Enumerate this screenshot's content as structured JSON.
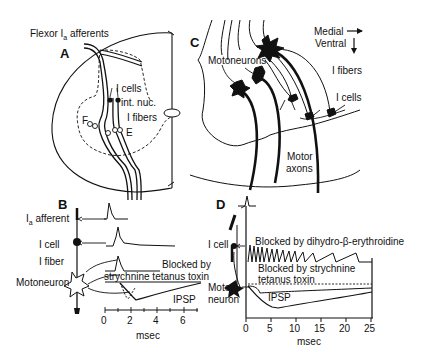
{
  "figure": {
    "panels": {
      "A": {
        "letter": "A",
        "title": "Flexor Ia afferents",
        "title_main": "Flexor I",
        "title_sub": "a",
        "title_tail": " afferents",
        "labels": {
          "i_cells": "I cells",
          "int_nuc": "int. nuc.",
          "i_fibers": "I fibers",
          "flexor": "F",
          "extensor": "E"
        }
      },
      "B": {
        "letter": "B",
        "labels": {
          "ia_afferent_main": "I",
          "ia_afferent_sub": "a",
          "ia_afferent_tail": " afferent",
          "i_cell": "I cell",
          "i_fiber": "I fiber",
          "motoneuron": "Motoneuron",
          "blocked_by": "Blocked by",
          "blockers": "strychnine tetanus toxin",
          "ipsp": "IPSP",
          "xlabel": "msec"
        },
        "x_ticks": [
          "0",
          "2",
          "4",
          "6"
        ]
      },
      "C": {
        "letter": "C",
        "labels": {
          "motoneurons": "Motoneurons",
          "medial": "Medial",
          "ventral": "Ventral",
          "i_fibers": "I fibers",
          "i_cells": "I cells",
          "motor": "Motor",
          "axons": "axons"
        }
      },
      "D": {
        "letter": "D",
        "labels": {
          "i_cell": "I cell",
          "moto": "Moto",
          "neuron": "neuron",
          "blocked_dhbe": "Blocked by dihydro-β-erythroidine",
          "blocked_strych": "Blocked by strychnine",
          "tetanus": "tetanus toxin",
          "ipsp": "IPSP",
          "xlabel": "msec"
        },
        "x_ticks": [
          "0",
          "5",
          "10",
          "15",
          "20",
          "25"
        ]
      }
    }
  }
}
